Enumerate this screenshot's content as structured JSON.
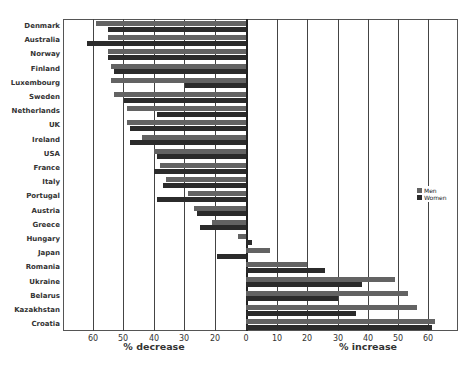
{
  "chart_data": {
    "type": "bar",
    "orientation": "horizontal",
    "title": "",
    "categories": [
      "Denmark",
      "Australia",
      "Norway",
      "Finland",
      "Luxembourg",
      "Sweden",
      "Netherlands",
      "UK",
      "Ireland",
      "USA",
      "France",
      "Italy",
      "Portugal",
      "Austria",
      "Greece",
      "Hungary",
      "Japan",
      "Romania",
      "Ukraine",
      "Belarus",
      "Kazakhstan",
      "Croatia"
    ],
    "series": [
      {
        "name": "Men",
        "color": "#636363",
        "values": [
          -59,
          -55,
          -55,
          -54,
          -54,
          -53,
          -49,
          -49,
          -44,
          -40,
          -38,
          -36,
          -29,
          -27,
          -21,
          -5,
          8,
          20,
          49,
          53,
          56,
          62
        ]
      },
      {
        "name": "Women",
        "color": "#2b2b2b",
        "values": [
          -55,
          -62,
          -55,
          -53,
          -30,
          -50,
          -39,
          -48,
          -48,
          -39,
          -40,
          -37,
          -39,
          -26,
          -25,
          2,
          -19,
          26,
          38,
          30,
          36,
          61
        ]
      }
    ],
    "xlabel_left": "% decrease",
    "xlabel_right": "% increase",
    "left_ticks": [
      "60",
      "50",
      "40",
      "30",
      "20",
      "0"
    ],
    "right_ticks": [
      "10",
      "20",
      "30",
      "40",
      "50",
      "60"
    ],
    "xlim": [
      -65,
      65
    ],
    "grid": true,
    "legend_position": "right-middle"
  },
  "legend": {
    "men": "Men",
    "women": "Women"
  },
  "axis": {
    "left_label": "% decrease",
    "right_label": "% increase"
  }
}
